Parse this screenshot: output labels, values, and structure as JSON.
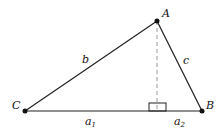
{
  "diagram": {
    "type": "triangle-with-altitude",
    "vertices": {
      "A": {
        "label": "A",
        "x": 157,
        "y": 21
      },
      "B": {
        "label": "B",
        "x": 202,
        "y": 111
      },
      "C": {
        "label": "C",
        "x": 25,
        "y": 111
      }
    },
    "sides": {
      "b": {
        "label": "b"
      },
      "c": {
        "label": "c"
      },
      "a1": {
        "label": "a",
        "sub": "1"
      },
      "a2": {
        "label": "a",
        "sub": "2"
      }
    },
    "altitude": {
      "from": "A",
      "foot_x": 157,
      "style": "dashed"
    },
    "colors": {
      "line": "#222222",
      "dash": "#999999",
      "point": "#111111"
    }
  }
}
